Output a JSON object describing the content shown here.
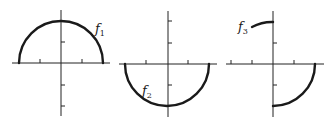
{
  "figure": {
    "graphs": [
      {
        "id": "g1",
        "function_label": "f",
        "subscript": "1",
        "description": "upper semicircle of radius 2 centered at origin"
      },
      {
        "id": "g2",
        "function_label": "f",
        "subscript": "2",
        "description": "lower semicircle of radius 2 centered at origin"
      },
      {
        "id": "g3",
        "function_label": "f",
        "subscript": "3",
        "description": "short arc near top-left of y-axis and quarter circle in fourth quadrant"
      }
    ]
  }
}
